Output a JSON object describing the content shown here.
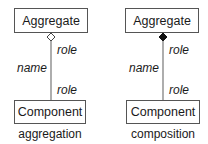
{
  "diagrams": [
    {
      "type": "aggregation",
      "whole": "Aggregate",
      "part": "Component",
      "name_label": "name",
      "top_role_label": "role",
      "bottom_role_label": "role",
      "caption": "aggregation",
      "diamond": "hollow"
    },
    {
      "type": "composition",
      "whole": "Aggregate",
      "part": "Component",
      "name_label": "name",
      "top_role_label": "role",
      "bottom_role_label": "role",
      "caption": "composition",
      "diamond": "filled"
    }
  ],
  "colors": {
    "stroke": "#555555",
    "text": "#1a1a1a",
    "background": "#ffffff"
  }
}
